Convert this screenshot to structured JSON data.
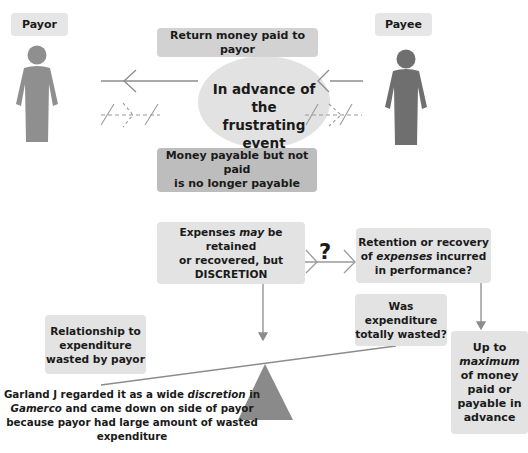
{
  "parties": {
    "payor": {
      "label": "Payor",
      "icon": "person-icon"
    },
    "payee": {
      "label": "Payee",
      "icon": "person-icon"
    }
  },
  "top_section": {
    "return_box": "Return money paid to payor",
    "event_ellipse": {
      "line1": "In advance of the",
      "line2": "frustrating event"
    },
    "payable_box": {
      "line1": "Money payable but not paid",
      "line2": "is no longer payable"
    },
    "arrows": [
      {
        "style": "solid",
        "direction": "payee-to-payor",
        "meaning": "return of money paid"
      },
      {
        "style": "dashed-crossed",
        "direction": "payor-to-payee",
        "meaning": "payment no longer payable"
      }
    ]
  },
  "bottom_section": {
    "expenses_box": {
      "pre": "Expenses ",
      "em": "may",
      "post": " be retained",
      "line2": "or recovered, but",
      "line3": "DISCRETION"
    },
    "question_mark": "?",
    "retention_box": {
      "line1": "Retention or recovery",
      "pre": "of ",
      "em": "expenses",
      "post": " incurred",
      "line3": "in performance?"
    },
    "wasted_box": {
      "line1": "Was",
      "line2": "expenditure",
      "line3": "totally wasted?"
    },
    "relationship_box": {
      "line1": "Relationship to",
      "line2": "expenditure",
      "line3": "wasted by payor"
    },
    "maximum_box": {
      "line1": "Up to",
      "em": "maximum",
      "line3": "of money",
      "line4": "paid or",
      "line5": "payable in",
      "line6": "advance"
    },
    "caption": {
      "pre1": "Garland J regarded it as a wide ",
      "em1": "discretion",
      "post1": " in",
      "em2": "Gamerco",
      "post2": " and came down on side of payor",
      "line3": "because payor had large amount of wasted",
      "line4": "expenditure"
    }
  },
  "colors": {
    "figure_payor": "#8f8f8f",
    "figure_payee": "#6f6f6f",
    "box_light": "#e3e3e3",
    "box_mid": "#d2d2d2",
    "box_dark": "#bdbdbd",
    "ellipse": "#e2e2e2",
    "triangle": "#8a8a8a",
    "line": "#8c8c8c"
  }
}
